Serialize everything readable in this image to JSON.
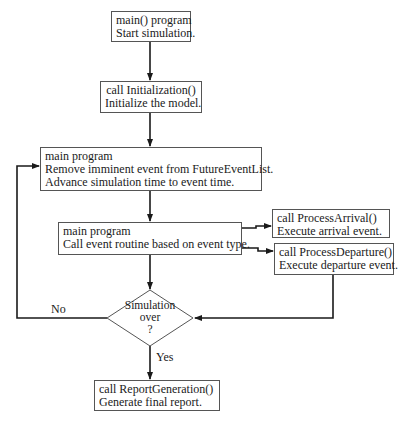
{
  "diagram": {
    "type": "flowchart",
    "nodes": {
      "start": {
        "line1": "main() program",
        "line2": "Start simulation."
      },
      "init": {
        "line1": "call Initialization()",
        "line2": "Initialize the model."
      },
      "advance": {
        "line1": "main program",
        "line2": "Remove imminent event from FutureEventList.",
        "line3": "Advance simulation time to event time."
      },
      "dispatch": {
        "line1": "main program",
        "line2": "Call event routine based on event type."
      },
      "arrival": {
        "line1": "call ProcessArrival()",
        "line2": "Execute arrival event."
      },
      "departure": {
        "line1": "call ProcessDeparture()",
        "line2": "Execute departure event."
      },
      "decision": {
        "line1": "Simulation",
        "line2": "over",
        "line3": "?"
      },
      "report": {
        "line1": "call ReportGeneration()",
        "line2": "Generate final report."
      }
    },
    "edge_labels": {
      "no": "No",
      "yes": "Yes"
    },
    "colors": {
      "line": "#1a1a1a",
      "box_border": "#555555",
      "background": "#ffffff"
    }
  }
}
